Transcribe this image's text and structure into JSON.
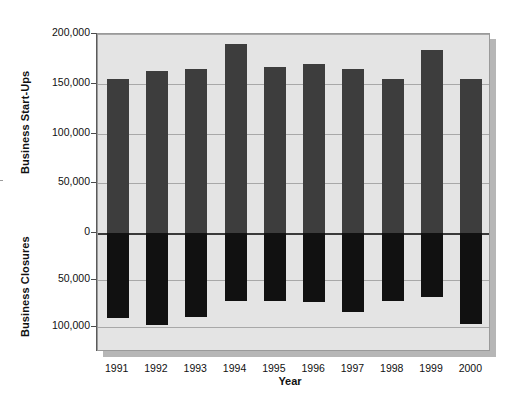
{
  "chart_data": {
    "type": "bar",
    "title": "",
    "subtitle": "",
    "xlabel": "Year",
    "ylabel_top": "Business Start-Ups",
    "ylabel_bottom": "Business Closures",
    "categories": [
      "1991",
      "1992",
      "1993",
      "1994",
      "1995",
      "1996",
      "1997",
      "1998",
      "1999",
      "2000"
    ],
    "series": [
      {
        "name": "Business Start-Ups",
        "direction": "up",
        "color": "#3d3d3d",
        "values": [
          155000,
          163000,
          165000,
          190000,
          167000,
          170000,
          165000,
          155000,
          184000,
          155000
        ]
      },
      {
        "name": "Business Closures",
        "direction": "down",
        "color": "#111111",
        "values": [
          90000,
          98000,
          89000,
          72000,
          72000,
          73000,
          84000,
          72000,
          68000,
          97000
        ]
      }
    ],
    "y_ticks_top": [
      {
        "label": "200,000",
        "value": 200000
      },
      {
        "label": "150,000",
        "value": 150000
      },
      {
        "label": "100,000",
        "value": 100000
      },
      {
        "label": "50,000",
        "value": 50000
      }
    ],
    "y_zero_tick": {
      "label": "0",
      "value": 0
    },
    "y_ticks_bottom": [
      {
        "label": "50,000",
        "value": 50000
      },
      {
        "label": "100,000",
        "value": 100000
      }
    ],
    "ylim_top": [
      0,
      200000
    ],
    "ylim_bottom": [
      0,
      110000
    ],
    "grid": true,
    "legend": "none",
    "plot_background": "#e4e4e4",
    "gridline_color": "#a8a8a8",
    "zeroline_color": "#3a3a3a"
  }
}
